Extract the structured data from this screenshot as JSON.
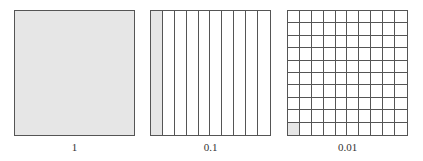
{
  "diagram": {
    "shade_color": "#e6e6e6",
    "line_color": "#555555",
    "squares": [
      {
        "label": "1",
        "columns": 1,
        "rows": 1,
        "shaded_parts": 1
      },
      {
        "label": "0.1",
        "columns": 10,
        "rows": 1,
        "shaded_parts": 1
      },
      {
        "label": "0.01",
        "columns": 10,
        "rows": 10,
        "shaded_parts": 1
      }
    ]
  }
}
